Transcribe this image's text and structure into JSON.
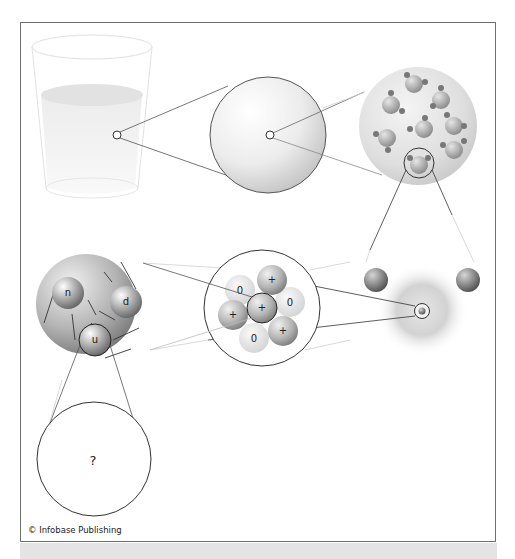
{
  "figure": {
    "credit": "© Infobase Publishing",
    "caption_visible": false
  },
  "stages": [
    {
      "id": "glass",
      "label": "glass of water"
    },
    {
      "id": "droplet",
      "label": "magnified drop"
    },
    {
      "id": "molecules",
      "label": "water molecules"
    },
    {
      "id": "atom",
      "label": "hydrogen/oxygen atom"
    },
    {
      "id": "nucleus",
      "label": "atomic nucleus"
    },
    {
      "id": "nucleon",
      "label": "nucleon with quarks"
    },
    {
      "id": "unknown",
      "label": "?"
    }
  ],
  "nucleus": {
    "nucleons": [
      {
        "charge": "0",
        "type": "neutron"
      },
      {
        "charge": "+",
        "type": "proton"
      },
      {
        "charge": "0",
        "type": "neutron"
      },
      {
        "charge": "+",
        "type": "proton"
      },
      {
        "charge": "+",
        "type": "proton"
      },
      {
        "charge": "0",
        "type": "neutron"
      },
      {
        "charge": "+",
        "type": "proton"
      }
    ]
  },
  "nucleon": {
    "quarks": [
      "n",
      "d",
      "u"
    ]
  },
  "unknown": {
    "symbol": "?"
  },
  "colors": {
    "frame": "#6e6e6e",
    "line": "#333333",
    "faint_line": "#c8c8c8",
    "caption_band": "#e4e4e4"
  }
}
